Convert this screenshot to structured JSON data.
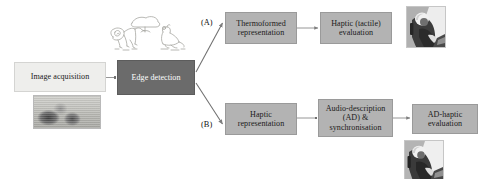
{
  "diagram": {
    "colors": {
      "box_light": "#eeeeec",
      "box_mid": "#b3b3b3",
      "box_dark": "#6b6b6b",
      "connector": "#8a8a8a",
      "text_dark": "#1a1a1a",
      "text_light": "#ffffff",
      "canvas": "#ffffff"
    },
    "nodes": [
      {
        "id": "image_acquisition",
        "label": "Image acquisition",
        "lines": [
          "Image acquisition"
        ],
        "style": "light"
      },
      {
        "id": "edge_detection",
        "label": "Edge detection",
        "lines": [
          "Edge detection"
        ],
        "style": "dark"
      },
      {
        "id": "thermoformed_representation",
        "label": "Thermoformed representation",
        "lines": [
          "Thermoformed",
          "representation"
        ],
        "style": "mid"
      },
      {
        "id": "haptic_tactile_evaluation",
        "label": "Haptic (tactile) evaluation",
        "lines": [
          "Haptic (tactile)",
          "evaluation"
        ],
        "style": "mid"
      },
      {
        "id": "haptic_representation",
        "label": "Haptic representation",
        "lines": [
          "Haptic",
          "representation"
        ],
        "style": "mid"
      },
      {
        "id": "audio_description_sync",
        "label": "Audio-description (AD) & synchronisation",
        "lines": [
          "Audio-description",
          "(AD) &",
          "synchronisation"
        ],
        "style": "mid"
      },
      {
        "id": "ad_haptic_evaluation",
        "label": "AD-haptic evaluation",
        "lines": [
          "AD-haptic",
          "evaluation"
        ],
        "style": "mid"
      }
    ],
    "branch_labels": [
      {
        "id": "branch_a",
        "label": "(A)"
      },
      {
        "id": "branch_b",
        "label": "(B)"
      }
    ],
    "media": [
      {
        "id": "sketch_lineart",
        "name": "edge-detected-line-art",
        "caption": "Line drawing of animals produced by edge detection"
      },
      {
        "id": "photo_source",
        "name": "source-photograph",
        "caption": "Greyscale source photograph of animals"
      },
      {
        "id": "photo_person_a",
        "name": "tactile-evaluation-photo",
        "caption": "Photograph of a person exploring a tactile graphic"
      },
      {
        "id": "photo_person_b",
        "name": "ad-haptic-evaluation-photo",
        "caption": "Photograph of a person exploring a tactile graphic with audio description"
      }
    ],
    "edges": [
      {
        "from": "image_acquisition",
        "to": "edge_detection",
        "kind": "arrow"
      },
      {
        "from": "edge_detection",
        "to": "thermoformed_representation",
        "kind": "arrow",
        "branch": "(A)"
      },
      {
        "from": "edge_detection",
        "to": "haptic_representation",
        "kind": "arrow",
        "branch": "(B)"
      },
      {
        "from": "thermoformed_representation",
        "to": "haptic_tactile_evaluation",
        "kind": "arrow"
      },
      {
        "from": "haptic_representation",
        "to": "audio_description_sync",
        "kind": "arrow"
      },
      {
        "from": "audio_description_sync",
        "to": "ad_haptic_evaluation",
        "kind": "arrow"
      }
    ]
  }
}
